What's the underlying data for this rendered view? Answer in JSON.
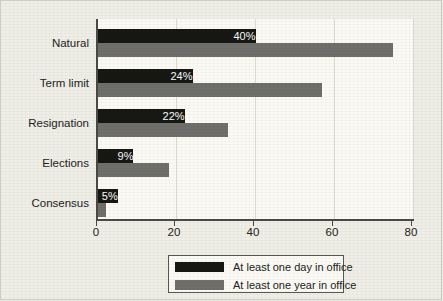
{
  "chart_data": {
    "type": "bar",
    "orientation": "horizontal",
    "title": "",
    "subtitle": "",
    "xlabel": "",
    "ylabel": "",
    "categories": [
      "Natural",
      "Term limit",
      "Resignation",
      "Elections",
      "Consensus"
    ],
    "series": [
      {
        "name": "At least one day in office",
        "color": "#171714",
        "values": [
          40,
          24,
          22,
          9,
          5
        ],
        "data_labels": [
          "40%",
          "24%",
          "22%",
          "9%",
          "5%"
        ]
      },
      {
        "name": "At least one year in office",
        "color": "#6f6f6b",
        "values": [
          75,
          57,
          33,
          18,
          2
        ],
        "data_labels": [
          "",
          "",
          "",
          "",
          ""
        ]
      }
    ],
    "xlim": [
      0,
      80
    ],
    "xticks": [
      0,
      20,
      40,
      60,
      80
    ],
    "xtick_labels": [
      "0",
      "20",
      "40",
      "60",
      "80"
    ],
    "grid": "vertical",
    "legend_position": "bottom-center"
  },
  "legend": {
    "entries": [
      {
        "label": "At least one day in office",
        "swatch": "#171714"
      },
      {
        "label": "At least one year in office",
        "swatch": "#6f6f6b"
      }
    ]
  },
  "colors": {
    "page_background": "#efeee7",
    "plot_background": "#fbfaf5",
    "axis": "#4a4a46",
    "gridline": "#dedcd1",
    "series_one_day": "#171714",
    "series_one_year": "#6f6f6b",
    "label_text": "#232320",
    "value_label_text": "#fdfdfb"
  }
}
